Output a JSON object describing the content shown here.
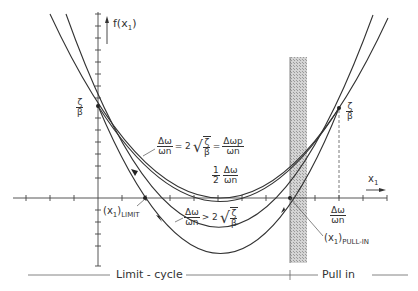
{
  "axes": {
    "y_label": "f(x",
    "y_label_sub": "1",
    "y_label_close": ")",
    "x_label": "x",
    "x_label_sub": "1"
  },
  "labels": {
    "zeta_over_beta_left": {
      "num": "ζ",
      "den": "β"
    },
    "zeta_over_beta_right": {
      "num": "ζ",
      "den": "β"
    },
    "eq_critical": {
      "lhs_num": "Δω",
      "lhs_den": "ωn",
      "mid": "= 2",
      "sqrt_num": "ζ",
      "sqrt_den": "β",
      "eq": "=",
      "rhs_num": "Δωp",
      "rhs_den": "ωn"
    },
    "half_term": {
      "coef_num": "1",
      "coef_den": "2",
      "num": "Δω",
      "den": "ωn"
    },
    "eq_greater": {
      "lhs_num": "Δω",
      "lhs_den": "ωn",
      "mid": "> 2",
      "sqrt_num": "ζ",
      "sqrt_den": "β"
    },
    "x_limit": {
      "text": "(x",
      "sub1": "1",
      "close": ")",
      "sub2": "LIMIT"
    },
    "x_pullin": {
      "text": "(x",
      "sub1": "1",
      "close": ")",
      "sub2": "PULL-IN"
    },
    "delta_omega_axis": {
      "num": "Δω",
      "den": "ωn"
    }
  },
  "regions": {
    "left": "Limit - cycle",
    "right": "Pull in"
  },
  "colors": {
    "ink": "#333333",
    "hatch": "#bdbdbd",
    "background": "#ffffff"
  }
}
